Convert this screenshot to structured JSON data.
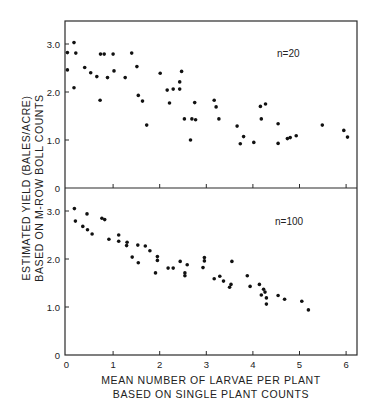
{
  "chart_data": {
    "type": "scatter",
    "xlabel": "MEAN NUMBER OF LARVAE PER PLANT",
    "xlabel_line2": "BASED ON SINGLE PLANT COUNTS",
    "ylabel": "ESTIMATED YIELD (BALES/ACRE)",
    "ylabel_line2": "BASED ON M-ROW BOLL COUNTS",
    "xlim": [
      0,
      6.2
    ],
    "ylim": [
      0,
      3.5
    ],
    "x_ticks": [
      "0",
      "1",
      "2",
      "3",
      "4",
      "5",
      "6"
    ],
    "y_ticks": [
      "0",
      "1.0",
      "2.0",
      "3.0"
    ],
    "grid": false,
    "panels": [
      {
        "annotation": "n=20",
        "points": [
          [
            0.02,
            2.82
          ],
          [
            0.02,
            2.46
          ],
          [
            0.16,
            3.03
          ],
          [
            0.2,
            2.81
          ],
          [
            0.16,
            2.09
          ],
          [
            0.39,
            2.51
          ],
          [
            0.52,
            2.4
          ],
          [
            0.65,
            2.32
          ],
          [
            0.72,
            1.83
          ],
          [
            0.73,
            2.79
          ],
          [
            0.81,
            2.79
          ],
          [
            0.88,
            2.3
          ],
          [
            1.0,
            2.79
          ],
          [
            1.02,
            2.44
          ],
          [
            1.26,
            2.3
          ],
          [
            1.4,
            2.81
          ],
          [
            1.51,
            2.53
          ],
          [
            1.54,
            1.93
          ],
          [
            1.63,
            1.81
          ],
          [
            1.72,
            1.31
          ],
          [
            2.01,
            2.39
          ],
          [
            2.16,
            2.04
          ],
          [
            2.29,
            2.06
          ],
          [
            2.43,
            2.06
          ],
          [
            2.43,
            2.21
          ],
          [
            2.47,
            2.43
          ],
          [
            2.21,
            1.77
          ],
          [
            2.53,
            1.44
          ],
          [
            2.69,
            1.44
          ],
          [
            2.77,
            1.42
          ],
          [
            2.75,
            1.78
          ],
          [
            2.66,
            1.0
          ],
          [
            3.17,
            1.83
          ],
          [
            3.21,
            1.69
          ],
          [
            3.27,
            1.44
          ],
          [
            3.66,
            1.29
          ],
          [
            3.8,
            1.07
          ],
          [
            3.73,
            0.92
          ],
          [
            4.02,
            0.95
          ],
          [
            4.16,
            1.7
          ],
          [
            4.27,
            1.75
          ],
          [
            4.18,
            1.44
          ],
          [
            4.54,
            1.34
          ],
          [
            4.54,
            0.93
          ],
          [
            4.74,
            1.03
          ],
          [
            4.8,
            1.05
          ],
          [
            4.93,
            1.09
          ],
          [
            5.49,
            1.31
          ],
          [
            5.95,
            1.2
          ],
          [
            6.03,
            1.06
          ]
        ]
      },
      {
        "annotation": "n=100",
        "points": [
          [
            0.17,
            3.05
          ],
          [
            0.19,
            2.79
          ],
          [
            0.35,
            2.68
          ],
          [
            0.44,
            2.94
          ],
          [
            0.45,
            2.61
          ],
          [
            0.55,
            2.52
          ],
          [
            0.76,
            2.85
          ],
          [
            0.82,
            2.82
          ],
          [
            0.91,
            2.41
          ],
          [
            1.12,
            2.5
          ],
          [
            1.12,
            2.37
          ],
          [
            1.3,
            2.35
          ],
          [
            1.29,
            2.28
          ],
          [
            1.41,
            2.04
          ],
          [
            1.53,
            2.29
          ],
          [
            1.54,
            1.92
          ],
          [
            1.69,
            2.27
          ],
          [
            1.79,
            2.17
          ],
          [
            1.91,
            1.71
          ],
          [
            1.95,
            2.05
          ],
          [
            1.95,
            1.97
          ],
          [
            2.18,
            1.81
          ],
          [
            2.29,
            1.81
          ],
          [
            2.44,
            1.95
          ],
          [
            2.54,
            1.71
          ],
          [
            2.54,
            1.65
          ],
          [
            2.59,
            1.88
          ],
          [
            2.96,
            2.03
          ],
          [
            2.96,
            1.96
          ],
          [
            2.93,
            1.82
          ],
          [
            3.55,
            1.95
          ],
          [
            3.17,
            1.59
          ],
          [
            3.29,
            1.64
          ],
          [
            3.37,
            1.54
          ],
          [
            3.53,
            1.47
          ],
          [
            3.5,
            1.41
          ],
          [
            3.88,
            1.65
          ],
          [
            3.94,
            1.43
          ],
          [
            4.14,
            1.47
          ],
          [
            4.23,
            1.37
          ],
          [
            4.26,
            1.31
          ],
          [
            4.18,
            1.25
          ],
          [
            4.29,
            1.19
          ],
          [
            4.29,
            1.06
          ],
          [
            4.54,
            1.24
          ],
          [
            4.68,
            1.16
          ],
          [
            5.05,
            1.12
          ],
          [
            5.19,
            0.94
          ]
        ]
      }
    ]
  }
}
